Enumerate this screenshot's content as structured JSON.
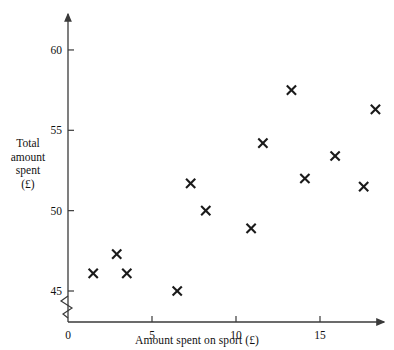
{
  "chart_data": {
    "type": "scatter",
    "title": "",
    "xlabel": "Amount spent on sport (£)",
    "ylabel_lines": [
      "Total",
      "amount",
      "spent",
      "(£)"
    ],
    "ylabel": "Total amount spent (£)",
    "xlim": [
      0,
      19.5
    ],
    "ylim": [
      44.2,
      61.6
    ],
    "y_axis_break": true,
    "grid": false,
    "legend": null,
    "marker": "x",
    "marker_color": "#1a1a1a",
    "xticks": [
      0,
      5,
      10,
      15
    ],
    "xtick_labels": [
      "0",
      "5",
      "10",
      "15"
    ],
    "yticks": [
      45,
      50,
      55,
      60
    ],
    "ytick_labels": [
      "45",
      "50",
      "55",
      "60"
    ],
    "points": [
      {
        "x": 1.5,
        "y": 46.1
      },
      {
        "x": 2.9,
        "y": 47.3
      },
      {
        "x": 3.5,
        "y": 46.1
      },
      {
        "x": 6.5,
        "y": 45.0
      },
      {
        "x": 7.3,
        "y": 51.7
      },
      {
        "x": 8.2,
        "y": 50.0
      },
      {
        "x": 10.9,
        "y": 48.9
      },
      {
        "x": 11.6,
        "y": 54.2
      },
      {
        "x": 13.3,
        "y": 57.5
      },
      {
        "x": 14.1,
        "y": 52.0
      },
      {
        "x": 15.9,
        "y": 53.4
      },
      {
        "x": 17.6,
        "y": 51.5
      },
      {
        "x": 18.3,
        "y": 56.3
      }
    ]
  }
}
